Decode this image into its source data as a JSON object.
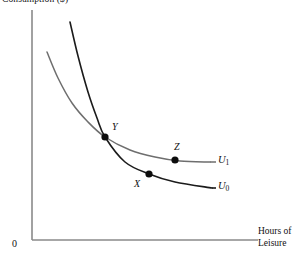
{
  "chart_data": {
    "type": "line",
    "title": "Consumption ($)",
    "ylabel": "Consumption ($)",
    "xlabel": "Hours of Leisure",
    "xlabel_line1": "Hours of",
    "xlabel_line2": "Leisure",
    "origin_label": "0",
    "grid": false,
    "legend_position": "right-of-curve-ends",
    "axis_color": "#8a8a8a",
    "series": [
      {
        "name": "U1",
        "label": "U",
        "subscript": "1",
        "color": "#6e6e6e",
        "description": "Higher indifference curve, flatter, passes through Y and Z",
        "points": [
          {
            "x": 47,
            "y": 52
          },
          {
            "x": 58,
            "y": 78
          },
          {
            "x": 72,
            "y": 103
          },
          {
            "x": 88,
            "y": 122
          },
          {
            "x": 105,
            "y": 137
          },
          {
            "x": 130,
            "y": 150
          },
          {
            "x": 155,
            "y": 157
          },
          {
            "x": 180,
            "y": 161
          },
          {
            "x": 210,
            "y": 162
          }
        ]
      },
      {
        "name": "U0",
        "label": "U",
        "subscript": "0",
        "color": "#1b1b1b",
        "description": "Lower indifference curve, steeper, passes through Y and X",
        "points": [
          {
            "x": 70,
            "y": 22
          },
          {
            "x": 78,
            "y": 56
          },
          {
            "x": 88,
            "y": 92
          },
          {
            "x": 97,
            "y": 118
          },
          {
            "x": 105,
            "y": 137
          },
          {
            "x": 125,
            "y": 162
          },
          {
            "x": 149,
            "y": 174
          },
          {
            "x": 175,
            "y": 182
          },
          {
            "x": 212,
            "y": 188
          }
        ]
      }
    ],
    "marked_points": [
      {
        "name": "Y",
        "label": "Y",
        "x": 105,
        "y": 137,
        "on_curves": [
          "U1",
          "U0"
        ],
        "label_dx": 7,
        "label_dy": -15
      },
      {
        "name": "Z",
        "label": "Z",
        "x": 175,
        "y": 160,
        "on_curves": [
          "U1"
        ],
        "label_dx": -1,
        "label_dy": -18
      },
      {
        "name": "X",
        "label": "X",
        "x": 149,
        "y": 174,
        "on_curves": [
          "U0"
        ],
        "label_dx": -15,
        "label_dy": 5
      }
    ],
    "axes": {
      "y_axis": {
        "x": 32,
        "y_top": 10,
        "y_bottom": 240
      },
      "x_axis": {
        "y": 240,
        "x_left": 32,
        "x_right": 258
      }
    },
    "leader_lines": [
      {
        "for": "U1",
        "x1": 210,
        "x2": 216,
        "y": 162
      },
      {
        "for": "U0",
        "x1": 212,
        "x2": 216,
        "y": 188
      }
    ]
  }
}
